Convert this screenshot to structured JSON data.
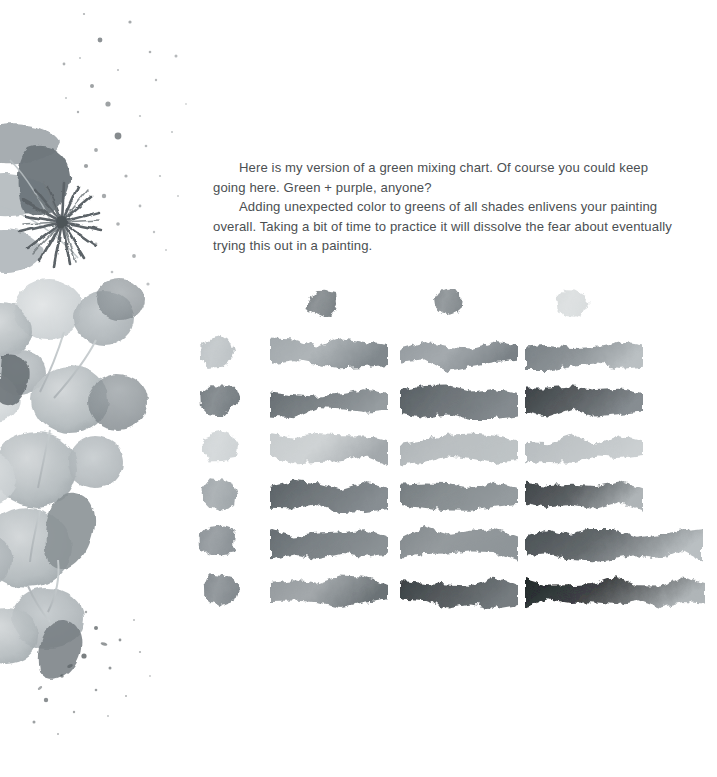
{
  "page": {
    "background_color": "#ffffff",
    "width": 717,
    "height": 777
  },
  "body_copy": {
    "text_color": "#4b4f52",
    "paragraph_1": "Here is my version of a green mixing chart. Of course you could keep going here. Green + purple, anyone?",
    "paragraph_2": "Adding unexpected color to greens of all shades enlivens your painting overall. Taking a bit of time to practice it will dissolve the fear about eventually trying this out in a painting."
  },
  "illustration": {
    "name": "eucalyptus-watercolor-illustration",
    "description": "Grayscale watercolor eucalyptus branch with round leaves, pointed leaves, a dark starburst seed pod and paint splatter",
    "ink_color": "#8e9396",
    "leaf_light": "#c2c7c9",
    "leaf_mid": "#a6acae",
    "leaf_dark": "#6f777b",
    "splatter_color": "#5d6468"
  },
  "chart_data": {
    "type": "table",
    "title": "Green mixing chart",
    "grid_rows": 6,
    "grid_columns": 3,
    "header_swatches": [
      {
        "label": "mixer-1",
        "color": "#737a7e"
      },
      {
        "label": "mixer-2",
        "color": "#7d8488"
      },
      {
        "label": "mixer-3",
        "color": "#d6dadb"
      }
    ],
    "base_swatches": [
      {
        "label": "base-1",
        "color": "#b9bfc2"
      },
      {
        "label": "base-2",
        "color": "#6c7479"
      },
      {
        "label": "base-3",
        "color": "#ccd1d3"
      },
      {
        "label": "base-4",
        "color": "#9aa1a5"
      },
      {
        "label": "base-5",
        "color": "#848b90"
      },
      {
        "label": "base-6",
        "color": "#7b8287"
      }
    ],
    "rows": [
      {
        "row": 1,
        "strokes": [
          {
            "column": 1,
            "start_color": "#9ba2a6",
            "end_color": "#777f84",
            "value": 0.45
          },
          {
            "column": 2,
            "start_color": "#8d9499",
            "end_color": "#6f777c",
            "value": 0.52
          },
          {
            "column": 3,
            "start_color": "#6e767b",
            "end_color": "#b5bbbe",
            "value": 0.48
          }
        ]
      },
      {
        "row": 2,
        "strokes": [
          {
            "column": 1,
            "start_color": "#5b6368",
            "end_color": "#8e9599",
            "value": 0.62
          },
          {
            "column": 2,
            "start_color": "#4a5257",
            "end_color": "#7b8287",
            "value": 0.7
          },
          {
            "column": 3,
            "start_color": "#2f3539",
            "end_color": "#7d8489",
            "value": 0.8
          }
        ]
      },
      {
        "row": 3,
        "strokes": [
          {
            "column": 1,
            "start_color": "#c3c8ca",
            "end_color": "#9ba1a5",
            "value": 0.25
          },
          {
            "column": 2,
            "start_color": "#a9afb2",
            "end_color": "#b9bfc1",
            "value": 0.28
          },
          {
            "column": 3,
            "start_color": "#b0b6b9",
            "end_color": "#c7ccce",
            "value": 0.24
          }
        ]
      },
      {
        "row": 4,
        "strokes": [
          {
            "column": 1,
            "start_color": "#4e565b",
            "end_color": "#7e858a",
            "value": 0.68
          },
          {
            "column": 2,
            "start_color": "#6a7276",
            "end_color": "#8d9498",
            "value": 0.55
          },
          {
            "column": 3,
            "start_color": "#31373b",
            "end_color": "#a8aeb1",
            "value": 0.78
          }
        ]
      },
      {
        "row": 5,
        "strokes": [
          {
            "column": 1,
            "start_color": "#5a6267",
            "end_color": "#82898d",
            "value": 0.6
          },
          {
            "column": 2,
            "start_color": "#7a8185",
            "end_color": "#868d91",
            "value": 0.52
          },
          {
            "column": 3,
            "start_color": "#3c4347",
            "end_color": "#b4babd",
            "value": 0.72
          }
        ]
      },
      {
        "row": 6,
        "strokes": [
          {
            "column": 1,
            "start_color": "#8c9296",
            "end_color": "#5f676b",
            "value": 0.58
          },
          {
            "column": 2,
            "start_color": "#2b3135",
            "end_color": "#6b7276",
            "value": 0.82
          },
          {
            "column": 3,
            "start_color": "#111416",
            "end_color": "#a9afb2",
            "value": 0.92
          }
        ]
      }
    ]
  }
}
